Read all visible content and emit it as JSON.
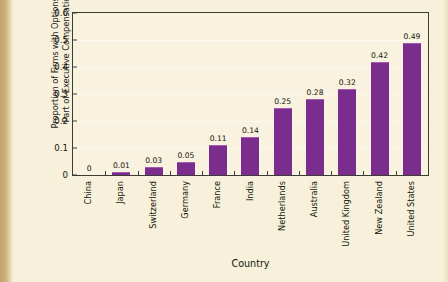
{
  "chart_data": {
    "type": "bar",
    "title": "",
    "xlabel": "Country",
    "ylabel": "Proportion of Firms with Options as Part of Executive Compensation",
    "ylabel_line1": "Proportion of Firms with Options as",
    "ylabel_line2": "Part of Executive Compensation",
    "categories": [
      "China",
      "Japan",
      "Switzerland",
      "Germany",
      "France",
      "India",
      "Netherlands",
      "Australia",
      "United Kingdom",
      "New Zealand",
      "United States"
    ],
    "values": [
      0,
      0.01,
      0.03,
      0.05,
      0.11,
      0.14,
      0.25,
      0.28,
      0.32,
      0.42,
      0.49
    ],
    "value_labels": [
      "0",
      "0.01",
      "0.03",
      "0.05",
      "0.11",
      "0.14",
      "0.25",
      "0.28",
      "0.32",
      "0.42",
      "0.49"
    ],
    "ylim": [
      0,
      0.6
    ],
    "yticks": [
      0,
      0.1,
      0.2,
      0.3,
      0.4,
      0.5,
      0.6
    ],
    "ytick_labels": [
      "0",
      "0.1",
      "0.2",
      "0.3",
      "0.4",
      "0.5",
      "0.6"
    ],
    "grid": true,
    "legend": null,
    "bar_color": "#7b2d8e",
    "bar_highlight_color": "#a15cb1",
    "plot_background": "#f8f2de",
    "page_background": "#f7f0da",
    "axis_color": "#3d3b33",
    "text_color": "#15150f"
  }
}
